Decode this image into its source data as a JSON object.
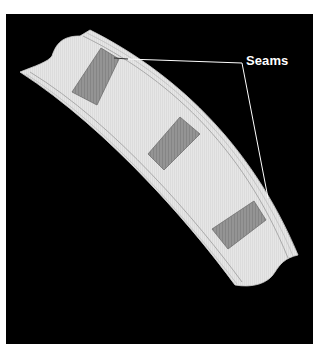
{
  "diagram": {
    "type": "illustration",
    "label": "Seams",
    "seam_count": 3,
    "colors": {
      "background": "#000000",
      "frame": "#ffffff",
      "band_fill": "#e4e4e4",
      "band_edge_lines": "#9a9a9a",
      "seam_fill": "#8f8f8f",
      "seam_stroke": "#6e6e6e",
      "leader_line": "#ffffff",
      "label_text": "#ffffff"
    }
  }
}
